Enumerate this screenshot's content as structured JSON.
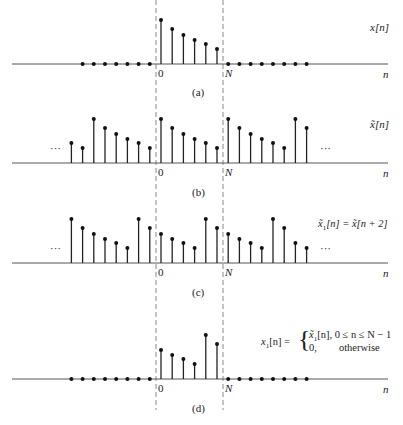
{
  "chart_data": [
    {
      "type": "stem",
      "panel": "(a)",
      "signal_label": "x[n]",
      "xlabel": "n",
      "markers": [
        "0",
        "N"
      ],
      "samples": [
        {
          "n": -7,
          "v": 0
        },
        {
          "n": -6,
          "v": 0
        },
        {
          "n": -5,
          "v": 0
        },
        {
          "n": -4,
          "v": 0
        },
        {
          "n": -3,
          "v": 0
        },
        {
          "n": -2,
          "v": 0
        },
        {
          "n": -1,
          "v": 0
        },
        {
          "n": 0,
          "v": 44
        },
        {
          "n": 1,
          "v": 35
        },
        {
          "n": 2,
          "v": 29
        },
        {
          "n": 3,
          "v": 24
        },
        {
          "n": 4,
          "v": 20
        },
        {
          "n": 5,
          "v": 15
        },
        {
          "n": 6,
          "v": 0
        },
        {
          "n": 7,
          "v": 0
        },
        {
          "n": 8,
          "v": 0
        },
        {
          "n": 9,
          "v": 0
        },
        {
          "n": 10,
          "v": 0
        },
        {
          "n": 11,
          "v": 0
        },
        {
          "n": 12,
          "v": 0
        },
        {
          "n": 13,
          "v": 0
        }
      ]
    },
    {
      "type": "stem",
      "panel": "(b)",
      "signal_label": "x̃[n]",
      "xlabel": "n",
      "markers": [
        "0",
        "N"
      ],
      "ellipsis": true,
      "samples": [
        {
          "n": -8,
          "v": 20
        },
        {
          "n": -7,
          "v": 15
        },
        {
          "n": -6,
          "v": 44
        },
        {
          "n": -5,
          "v": 35
        },
        {
          "n": -4,
          "v": 29
        },
        {
          "n": -3,
          "v": 24
        },
        {
          "n": -2,
          "v": 20
        },
        {
          "n": -1,
          "v": 15
        },
        {
          "n": 0,
          "v": 44
        },
        {
          "n": 1,
          "v": 35
        },
        {
          "n": 2,
          "v": 29
        },
        {
          "n": 3,
          "v": 24
        },
        {
          "n": 4,
          "v": 20
        },
        {
          "n": 5,
          "v": 15
        },
        {
          "n": 6,
          "v": 44
        },
        {
          "n": 7,
          "v": 35
        },
        {
          "n": 8,
          "v": 29
        },
        {
          "n": 9,
          "v": 24
        },
        {
          "n": 10,
          "v": 20
        },
        {
          "n": 11,
          "v": 15
        },
        {
          "n": 12,
          "v": 44
        },
        {
          "n": 13,
          "v": 35
        }
      ]
    },
    {
      "type": "stem",
      "panel": "(c)",
      "signal_label": "x̃₁[n] = x̃[n + 2]",
      "xlabel": "n",
      "markers": [
        "0",
        "N"
      ],
      "ellipsis": true,
      "samples": [
        {
          "n": -8,
          "v": 44
        },
        {
          "n": -7,
          "v": 35
        },
        {
          "n": -6,
          "v": 29
        },
        {
          "n": -5,
          "v": 24
        },
        {
          "n": -4,
          "v": 20
        },
        {
          "n": -3,
          "v": 15
        },
        {
          "n": -2,
          "v": 44
        },
        {
          "n": -1,
          "v": 35
        },
        {
          "n": 0,
          "v": 29
        },
        {
          "n": 1,
          "v": 24
        },
        {
          "n": 2,
          "v": 20
        },
        {
          "n": 3,
          "v": 15
        },
        {
          "n": 4,
          "v": 44
        },
        {
          "n": 5,
          "v": 35
        },
        {
          "n": 6,
          "v": 29
        },
        {
          "n": 7,
          "v": 24
        },
        {
          "n": 8,
          "v": 20
        },
        {
          "n": 9,
          "v": 15
        },
        {
          "n": 10,
          "v": 44
        },
        {
          "n": 11,
          "v": 35
        },
        {
          "n": 12,
          "v": 20
        },
        {
          "n": 13,
          "v": 15
        }
      ]
    },
    {
      "type": "stem",
      "panel": "(d)",
      "signal_label": "x₁[n] = { x̃₁[n], 0 ≤ n ≤ N − 1 ; 0, otherwise }",
      "xlabel": "n",
      "markers": [
        "0",
        "N"
      ],
      "samples": [
        {
          "n": -8,
          "v": 0
        },
        {
          "n": -7,
          "v": 0
        },
        {
          "n": -6,
          "v": 0
        },
        {
          "n": -5,
          "v": 0
        },
        {
          "n": -4,
          "v": 0
        },
        {
          "n": -3,
          "v": 0
        },
        {
          "n": -2,
          "v": 0
        },
        {
          "n": -1,
          "v": 0
        },
        {
          "n": 0,
          "v": 29
        },
        {
          "n": 1,
          "v": 24
        },
        {
          "n": 2,
          "v": 20
        },
        {
          "n": 3,
          "v": 15
        },
        {
          "n": 4,
          "v": 44
        },
        {
          "n": 5,
          "v": 35
        },
        {
          "n": 6,
          "v": 0
        },
        {
          "n": 7,
          "v": 0
        },
        {
          "n": 8,
          "v": 0
        },
        {
          "n": 9,
          "v": 0
        },
        {
          "n": 10,
          "v": 0
        },
        {
          "n": 11,
          "v": 0
        },
        {
          "n": 12,
          "v": 0
        },
        {
          "n": 13,
          "v": 0
        }
      ]
    }
  ],
  "layout": {
    "n0_x": 161,
    "dx": 11.2,
    "baselines": [
      64,
      163,
      263,
      379
    ],
    "dash_x": [
      156,
      223
    ],
    "axis_x": [
      12,
      388
    ]
  },
  "labels": {
    "zero": "0",
    "N": "N",
    "n": "n",
    "ellipsis": "···",
    "a": {
      "caption": "(a)",
      "signal": "x[n]"
    },
    "b": {
      "caption": "(b)",
      "signal_x": "x̃",
      "signal_arg": "[n]"
    },
    "c": {
      "caption": "(c)",
      "lhs": "x̃",
      "sub": "1",
      "mid": "[n] = ",
      "rhs": "x̃[n + 2]"
    },
    "d": {
      "caption": "(d)",
      "lhs": "x",
      "sub": "1",
      "mid": "[n] = ",
      "row1_a": "x̃",
      "row1_sub": "1",
      "row1_b": "[n], 0 ≤ n ≤ N − 1",
      "row2_a": "0,",
      "row2_b": "otherwise"
    }
  }
}
